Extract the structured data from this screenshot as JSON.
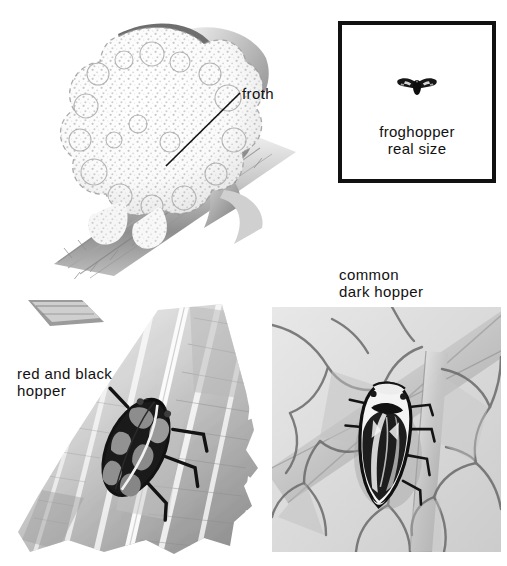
{
  "plate": {
    "width": 507,
    "height": 566,
    "background_color": "#ffffff",
    "ink_color": "#111111",
    "style": "grayscale natural-history illustration plate",
    "subject": "froghoppers (spittlebugs)"
  },
  "callouts": {
    "froth": {
      "text": "froth",
      "leader_from": [
        168,
        165
      ],
      "leader_to": [
        240,
        92
      ]
    }
  },
  "real_size_box": {
    "caption": "froghopper\nreal size",
    "caption_line_1": "froghopper",
    "caption_line_2": "real size",
    "border_color": "#111111",
    "border_width_px": 4,
    "specimen_color": "#161616",
    "specimen_name": "froghopper-silhouette"
  },
  "specimens": [
    {
      "id": "froth-mass",
      "label": "froth",
      "description": "spittle froth mass on hairy plant stem"
    },
    {
      "id": "red-and-black-hopper",
      "label": "red and black\nhopper",
      "label_line_1": "red and black",
      "label_line_2": "hopper",
      "description": "red and black froghopper resting on a torn leaf"
    },
    {
      "id": "common-dark-hopper",
      "label": "common\ndark hopper",
      "label_line_1": "common",
      "label_line_2": "dark hopper",
      "description": "common dark froghopper on a veined leaf panel"
    }
  ],
  "labels": {
    "froth": "froth",
    "real_size_caption": "froghopper\nreal size",
    "red_and_black_hopper": "red and black\nhopper",
    "common_dark_hopper": "common\ndark hopper"
  },
  "colors": {
    "paper": "#ffffff",
    "ink": "#111111",
    "mid_gray": "#9a9a9a",
    "light_gray": "#d8d8d8",
    "dark_gray": "#4a4a4a"
  }
}
